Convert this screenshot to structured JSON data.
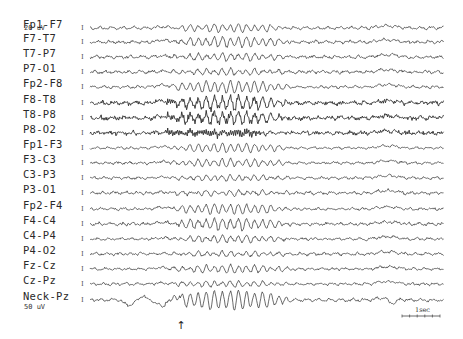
{
  "figure": {
    "type": "EEG montage recording",
    "trace_color": "#2b2b2b",
    "background": "#ffffff"
  },
  "calibration": {
    "top_label": "20 uV",
    "bottom_label": "50 uV",
    "mark_glyph": "I"
  },
  "time_scale": {
    "label": "1sec"
  },
  "event_marker": {
    "glyph": "↑",
    "x": 181
  },
  "channels": [
    {
      "name": "Fp1-F7",
      "y": 28,
      "amp": 1.6,
      "burst": 3.5,
      "noise": 0.9,
      "fast": 0.0
    },
    {
      "name": "F7-T7",
      "y": 42,
      "amp": 1.4,
      "burst": 4.5,
      "noise": 1.0,
      "fast": 0.4
    },
    {
      "name": "T7-P7",
      "y": 57,
      "amp": 1.5,
      "burst": 3.0,
      "noise": 1.1,
      "fast": 0.3
    },
    {
      "name": "P7-O1",
      "y": 72,
      "amp": 1.6,
      "burst": 2.5,
      "noise": 1.2,
      "fast": 0.2
    },
    {
      "name": "Fp2-F8",
      "y": 87,
      "amp": 1.4,
      "burst": 5.5,
      "noise": 0.8,
      "fast": 0.3
    },
    {
      "name": "F8-T8",
      "y": 103,
      "amp": 1.6,
      "burst": 6.0,
      "noise": 1.3,
      "fast": 1.6
    },
    {
      "name": "T8-P8",
      "y": 118,
      "amp": 1.6,
      "burst": 5.0,
      "noise": 1.3,
      "fast": 1.8
    },
    {
      "name": "P8-O2",
      "y": 133,
      "amp": 1.5,
      "burst": 1.0,
      "noise": 1.0,
      "fast": 2.0
    },
    {
      "name": "Fp1-F3",
      "y": 148,
      "amp": 1.2,
      "burst": 4.0,
      "noise": 0.7,
      "fast": 0.0
    },
    {
      "name": "F3-C3",
      "y": 163,
      "amp": 1.3,
      "burst": 3.5,
      "noise": 0.9,
      "fast": 0.2
    },
    {
      "name": "C3-P3",
      "y": 178,
      "amp": 1.3,
      "burst": 2.5,
      "noise": 0.9,
      "fast": 0.1
    },
    {
      "name": "P3-O1",
      "y": 193,
      "amp": 1.6,
      "burst": 2.0,
      "noise": 1.1,
      "fast": 0.2
    },
    {
      "name": "Fp2-F4",
      "y": 209,
      "amp": 1.3,
      "burst": 4.5,
      "noise": 0.8,
      "fast": 0.3
    },
    {
      "name": "F4-C4",
      "y": 224,
      "amp": 1.4,
      "burst": 5.0,
      "noise": 1.0,
      "fast": 0.7
    },
    {
      "name": "C4-P4",
      "y": 239,
      "amp": 1.3,
      "burst": 3.0,
      "noise": 0.9,
      "fast": 0.3
    },
    {
      "name": "P4-O2",
      "y": 254,
      "amp": 1.5,
      "burst": 2.0,
      "noise": 1.0,
      "fast": 0.2
    },
    {
      "name": "Fz-Cz",
      "y": 269,
      "amp": 1.3,
      "burst": 3.5,
      "noise": 0.9,
      "fast": 0.2
    },
    {
      "name": "Cz-Pz",
      "y": 284,
      "amp": 1.3,
      "burst": 2.5,
      "noise": 0.9,
      "fast": 0.1
    },
    {
      "name": "Neck-Pz",
      "y": 300,
      "amp": 1.6,
      "burst": 9.0,
      "noise": 1.0,
      "fast": 0.2
    }
  ]
}
